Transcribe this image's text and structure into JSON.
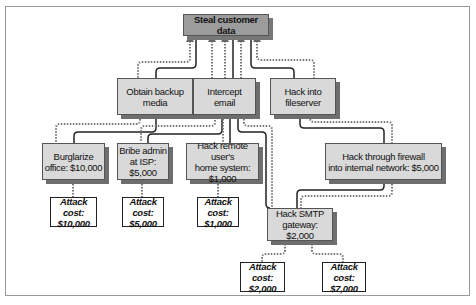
{
  "diagram": {
    "type": "attack-tree",
    "root": {
      "label": "Steal customer data"
    },
    "level1": [
      {
        "id": "obtain-backup",
        "label": "Obtain backup\nmedia"
      },
      {
        "id": "intercept-email",
        "label": "Intercept\nemail"
      },
      {
        "id": "hack-fileserver",
        "label": "Hack into\nfileserver"
      }
    ],
    "level2": [
      {
        "id": "burglarize",
        "label": "Burglarize\noffice: $10,000"
      },
      {
        "id": "bribe-admin",
        "label": "Bribe admin\nat ISP: $5,000"
      },
      {
        "id": "hack-remote",
        "label": "Hack remote user's\nhome system: $1,000"
      },
      {
        "id": "hack-firewall",
        "label": "Hack through firewall\ninto internal network: $5,000"
      }
    ],
    "level3": [
      {
        "id": "hack-smtp",
        "label": "Hack SMTP\ngateway: $2,000"
      }
    ],
    "attack_costs": [
      {
        "label": "Attack cost:\n$10,000"
      },
      {
        "label": "Attack cost:\n$5,000"
      },
      {
        "label": "Attack cost:\n$1,000"
      },
      {
        "label": "Attack cost:\n$2,000"
      },
      {
        "label": "Attack cost:\n$7,000"
      }
    ],
    "colors": {
      "root_fill": "#9c9c9c",
      "node_fill": "#d9d9d9",
      "shadow": "#6e6e6e",
      "line": "#222222",
      "dotted_line": "#777777"
    },
    "edge_styles": {
      "solid": "attack path",
      "dotted": "cost path"
    }
  }
}
